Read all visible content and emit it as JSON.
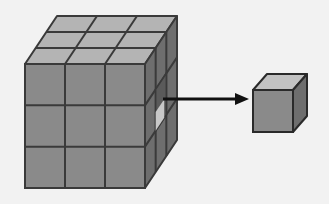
{
  "diagram": {
    "large_cube": {
      "grid": 3,
      "front_face": {
        "x": 25,
        "y": 64,
        "w": 120,
        "h": 124
      },
      "depth_offset": {
        "dx": 32,
        "dy": -48
      },
      "colors": {
        "front": "#8a8a8a",
        "top": "#b4b4b4",
        "side": "#6e6e6e",
        "stroke": "#3a3a3a"
      }
    },
    "arrow": {
      "x1": 163,
      "y1": 99,
      "x2": 249,
      "y2": 99,
      "color": "#111111"
    },
    "unit_cube": {
      "front_face": {
        "x": 253,
        "y": 90,
        "w": 40,
        "h": 42
      },
      "depth_offset": {
        "dx": 14,
        "dy": -16
      },
      "colors": {
        "front": "#8a8a8a",
        "top": "#c2c2c2",
        "side": "#6e6e6e",
        "stroke": "#2a2a2a"
      }
    },
    "background": "#f2f2f2"
  }
}
